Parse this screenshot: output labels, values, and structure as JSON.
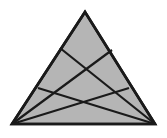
{
  "figure": {
    "type": "geometric-diagram",
    "canvas": {
      "width": 167,
      "height": 138,
      "background": "#ffffff"
    },
    "style": {
      "fill_color": "#b5b5b5",
      "stroke_color": "#1a1a1a",
      "outline_width": 2.6,
      "cevian_width": 2.2
    },
    "vertices": {
      "apex": {
        "name": "A",
        "x": 85,
        "y": 12
      },
      "bottom_left": {
        "name": "B",
        "x": 12,
        "y": 124
      },
      "bottom_right": {
        "name": "C",
        "x": 155,
        "y": 124
      }
    },
    "edge_points": [
      {
        "name": "P1",
        "edge": "left",
        "x": 60,
        "y": 48
      },
      {
        "name": "P2",
        "edge": "left",
        "x": 38,
        "y": 88
      },
      {
        "name": "Q1",
        "edge": "right",
        "x": 112,
        "y": 50
      },
      {
        "name": "Q2",
        "edge": "right",
        "x": 129,
        "y": 88
      }
    ],
    "cevians": [
      {
        "name": "cevian-bl-to-q1",
        "from": "bottom_left",
        "to": "Q1",
        "x1": 12,
        "y1": 124,
        "x2": 112,
        "y2": 50
      },
      {
        "name": "cevian-bl-to-q2",
        "from": "bottom_left",
        "to": "Q2",
        "x1": 12,
        "y1": 124,
        "x2": 129,
        "y2": 88
      },
      {
        "name": "cevian-br-to-p1",
        "from": "bottom_right",
        "to": "P1",
        "x1": 155,
        "y1": 124,
        "x2": 60,
        "y2": 48
      },
      {
        "name": "cevian-br-to-p2",
        "from": "bottom_right",
        "to": "P2",
        "x1": 155,
        "y1": 124,
        "x2": 38,
        "y2": 88
      }
    ],
    "intersections": [
      {
        "name": "upper-crossing",
        "x": 83,
        "y": 68
      },
      {
        "name": "lower-crossing",
        "x": 82,
        "y": 99
      }
    ],
    "labels": []
  }
}
